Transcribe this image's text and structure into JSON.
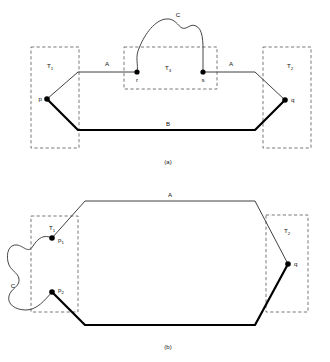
{
  "figure": {
    "panels": [
      {
        "id": "a",
        "caption": "(a)",
        "boxes": [
          {
            "name": "T1",
            "label_main": "T",
            "label_sub": "1"
          },
          {
            "name": "T3",
            "label_main": "T",
            "label_sub": "3"
          },
          {
            "name": "T2",
            "label_main": "T",
            "label_sub": "2"
          }
        ],
        "arc_labels": {
          "a_left": "A",
          "a_right": "A",
          "b": "B",
          "c": "C"
        },
        "points": [
          {
            "name": "p",
            "label_main": "p",
            "label_sub": ""
          },
          {
            "name": "r",
            "label_main": "r",
            "label_sub": ""
          },
          {
            "name": "s",
            "label_main": "s",
            "label_sub": ""
          },
          {
            "name": "q",
            "label_main": "q",
            "label_sub": ""
          }
        ]
      },
      {
        "id": "b",
        "caption": "(b)",
        "boxes": [
          {
            "name": "T1",
            "label_main": "T",
            "label_sub": "1"
          },
          {
            "name": "T2",
            "label_main": "T",
            "label_sub": "2"
          }
        ],
        "arc_labels": {
          "a": "A",
          "b": "B",
          "c": "C"
        },
        "points": [
          {
            "name": "p1",
            "label_main": "p",
            "label_sub": "1"
          },
          {
            "name": "p2",
            "label_main": "p",
            "label_sub": "2"
          },
          {
            "name": "q",
            "label_main": "q",
            "label_sub": ""
          }
        ]
      }
    ],
    "colors": {
      "ink": "#000000",
      "thin_stroke": "#2a2a2a",
      "dashed_box": "#555555",
      "background": "#ffffff"
    }
  }
}
